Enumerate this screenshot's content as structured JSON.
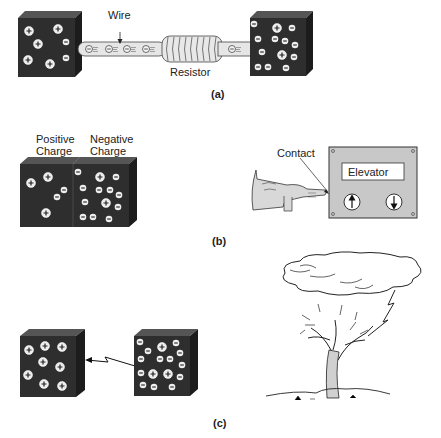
{
  "panel_a": {
    "wire_label": "Wire",
    "resistor_label": "Resistor",
    "caption": "(a)"
  },
  "panel_b": {
    "positive_label_1": "Positive",
    "positive_label_2": "Charge",
    "negative_label_1": "Negative",
    "negative_label_2": "Charge",
    "contact_label": "Contact",
    "elevator_label": "Elevator",
    "caption": "(b)"
  },
  "panel_c": {
    "caption": "(c)"
  },
  "colors": {
    "block": "#2e2e2e",
    "block_side": "#1c1c1c",
    "panel_gray": "#c8c8c8",
    "wire": "#e6e6e6"
  }
}
